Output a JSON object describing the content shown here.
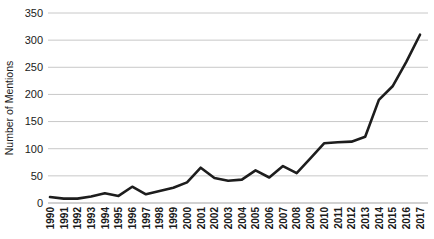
{
  "chart_data": {
    "type": "line",
    "title": "",
    "xlabel": "",
    "ylabel": "Number of Mentions",
    "x": [
      1990,
      1991,
      1992,
      1993,
      1994,
      1995,
      1996,
      1997,
      1998,
      1999,
      2000,
      2001,
      2002,
      2003,
      2004,
      2005,
      2006,
      2007,
      2008,
      2009,
      2010,
      2011,
      2012,
      2013,
      2014,
      2015,
      2016,
      2017
    ],
    "series": [
      {
        "name": "Number of Mentions",
        "values": [
          11,
          8,
          8,
          12,
          18,
          13,
          30,
          16,
          22,
          28,
          38,
          65,
          46,
          41,
          43,
          60,
          47,
          68,
          55,
          82,
          110,
          112,
          113,
          122,
          190,
          215,
          260,
          310
        ]
      }
    ],
    "ylim": [
      0,
      350
    ],
    "ytick_step": 50,
    "yticks": [
      0,
      50,
      100,
      150,
      200,
      250,
      300,
      350
    ],
    "grid": true,
    "legend": false,
    "colors": {
      "line": "#1d1d1d",
      "gridline": "#c8c8c8",
      "axis": "#a3a3a3",
      "tick_label": "#1a1a1a",
      "axis_title": "#1a1a1a"
    }
  }
}
